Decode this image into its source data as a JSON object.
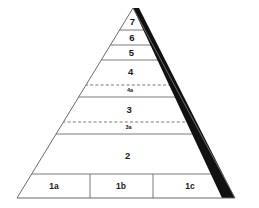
{
  "diagram": {
    "type": "pyramid",
    "title": "",
    "apex": {
      "x": 133,
      "y": 8
    },
    "base_left": {
      "x": 17,
      "y": 198
    },
    "base_right": {
      "x": 235,
      "y": 198
    },
    "colors": {
      "background": "#ffffff",
      "outline": "#6b6b6b",
      "divider_solid": "#7a7a7a",
      "divider_dashed": "#6b6b6b",
      "shadow_wedge": "#111111",
      "label_text": "#1a1a1a"
    },
    "tiers": [
      {
        "label": "7",
        "style": "main",
        "top_y": 8,
        "bottom_y": 30,
        "label_y": 22,
        "divider": "solid"
      },
      {
        "label": "6",
        "style": "main",
        "top_y": 30,
        "bottom_y": 45,
        "label_y": 38,
        "divider": "solid"
      },
      {
        "label": "5",
        "style": "main",
        "top_y": 45,
        "bottom_y": 60,
        "label_y": 53,
        "divider": "solid"
      },
      {
        "label": "4",
        "style": "main",
        "top_y": 60,
        "bottom_y": 85,
        "label_y": 72,
        "divider": "dashed"
      },
      {
        "label": "4a",
        "style": "sub",
        "top_y": 85,
        "bottom_y": 97,
        "label_y": 91,
        "divider": "solid"
      },
      {
        "label": "3",
        "style": "main",
        "top_y": 97,
        "bottom_y": 122,
        "label_y": 110,
        "divider": "dashed"
      },
      {
        "label": "3a",
        "style": "sub",
        "top_y": 122,
        "bottom_y": 134,
        "label_y": 128,
        "divider": "solid"
      },
      {
        "label": "2",
        "style": "main",
        "top_y": 134,
        "bottom_y": 174,
        "label_y": 156,
        "divider": "solid"
      }
    ],
    "base_row": {
      "top_y": 174,
      "bottom_y": 198,
      "label_y": 187,
      "divider_x": [
        90,
        153
      ],
      "cells": [
        {
          "label": "1a",
          "center_x": 54
        },
        {
          "label": "1b",
          "center_x": 121
        },
        {
          "label": "1c",
          "center_x": 190
        }
      ]
    }
  }
}
